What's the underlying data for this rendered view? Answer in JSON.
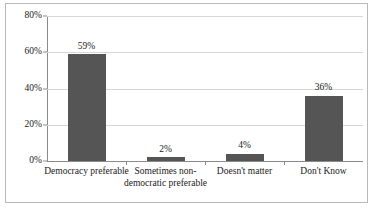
{
  "chart_data": {
    "type": "bar",
    "title": "",
    "subtitle": "",
    "xlabel": "",
    "ylabel": "",
    "categories": [
      "Democracy preferable",
      "Sometimes non-democratic preferable",
      "Doesn't matter",
      "Don't Know"
    ],
    "values": [
      59,
      2,
      4,
      36
    ],
    "value_labels": [
      "59%",
      "2%",
      "4%",
      "36%"
    ],
    "ylim": [
      0,
      80
    ],
    "ytick_values": [
      0,
      20,
      40,
      60,
      80
    ],
    "ytick_labels": [
      "0%",
      "20%",
      "40%",
      "60%",
      "80%"
    ],
    "grid": true,
    "legend": false,
    "bar_color": "#555555",
    "gridline_color": "#d6d6d6",
    "axis_color": "#8a8a8a",
    "frame_color": "#b9b9b9",
    "background_color": "#ffffff"
  }
}
